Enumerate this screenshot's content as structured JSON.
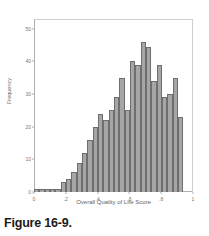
{
  "caption": "Figure 16-9.",
  "chart_data": {
    "type": "bar",
    "title": "",
    "xlabel": "Overall Quality of Life Score",
    "ylabel": "Frequency",
    "xlim": [
      0,
      1
    ],
    "ylim": [
      0,
      53
    ],
    "grid": false,
    "legend": null,
    "bin_width": 0.032,
    "xticks": [
      0,
      0.2,
      0.4,
      0.6,
      0.8,
      1
    ],
    "xticklabels": [
      "0",
      ".2",
      ".4",
      ".6",
      ".8",
      "1"
    ],
    "yticks": [
      0,
      10,
      20,
      30,
      40,
      50
    ],
    "yticklabels": [
      "0",
      "10",
      "20",
      "30",
      "40",
      "50"
    ],
    "categories": [
      "0.00",
      "0.03",
      "0.06",
      "0.10",
      "0.13",
      "0.16",
      "0.19",
      "0.23",
      "0.26",
      "0.29",
      "0.32",
      "0.36",
      "0.39",
      "0.42",
      "0.45",
      "0.48",
      "0.52",
      "0.55",
      "0.58",
      "0.61",
      "0.65",
      "0.68",
      "0.71",
      "0.74",
      "0.77",
      "0.81",
      "0.84",
      "0.87",
      "0.90",
      "0.94",
      "0.97"
    ],
    "values": [
      1,
      1,
      1,
      1,
      1,
      3,
      4,
      6,
      9,
      12,
      16,
      20,
      24,
      22,
      25,
      29,
      35,
      25,
      40,
      39,
      46,
      44.5,
      34,
      39,
      29,
      30,
      35,
      23,
      0,
      0,
      0
    ],
    "bars": [
      {
        "x": "0.00",
        "y": 1
      },
      {
        "x": "0.03",
        "y": 1
      },
      {
        "x": "0.06",
        "y": 1
      },
      {
        "x": "0.10",
        "y": 1
      },
      {
        "x": "0.13",
        "y": 1
      },
      {
        "x": "0.16",
        "y": 3
      },
      {
        "x": "0.19",
        "y": 4
      },
      {
        "x": "0.23",
        "y": 6
      },
      {
        "x": "0.26",
        "y": 9
      },
      {
        "x": "0.29",
        "y": 12
      },
      {
        "x": "0.32",
        "y": 16
      },
      {
        "x": "0.36",
        "y": 20
      },
      {
        "x": "0.39",
        "y": 24
      },
      {
        "x": "0.42",
        "y": 22
      },
      {
        "x": "0.45",
        "y": 25
      },
      {
        "x": "0.48",
        "y": 29
      },
      {
        "x": "0.52",
        "y": 35
      },
      {
        "x": "0.55",
        "y": 25
      },
      {
        "x": "0.58",
        "y": 40
      },
      {
        "x": "0.61",
        "y": 39
      },
      {
        "x": "0.65",
        "y": 46
      },
      {
        "x": "0.68",
        "y": 44.5
      },
      {
        "x": "0.71",
        "y": 34
      },
      {
        "x": "0.74",
        "y": 39
      },
      {
        "x": "0.77",
        "y": 29
      },
      {
        "x": "0.81",
        "y": 30
      },
      {
        "x": "0.84",
        "y": 35
      },
      {
        "x": "0.87",
        "y": 23
      }
    ],
    "colors": {
      "bar_fill": "#a6a6a6",
      "bar_edge": "#6e6e6e",
      "axis": "#b0b0b0",
      "tick_text": "#777777",
      "label_text": "#5f5f5f",
      "background": "#ffffff"
    }
  }
}
